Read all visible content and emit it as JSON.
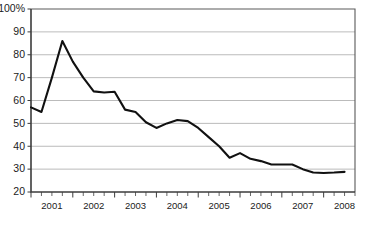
{
  "chart_data": {
    "type": "line",
    "title": "",
    "subtitle": "",
    "xlabel": "",
    "ylabel": "",
    "ylim": [
      20,
      100
    ],
    "xlim": [
      2001.0,
      2008.75
    ],
    "grid": true,
    "grid_axis": "y",
    "legend": false,
    "legend_position": "none",
    "y_tick_labels": [
      "100%",
      "90",
      "80",
      "70",
      "60",
      "50",
      "40",
      "30",
      "20"
    ],
    "y_tick_values": [
      100,
      90,
      80,
      70,
      60,
      50,
      40,
      30,
      20
    ],
    "x_tick_labels": [
      "2001",
      "2002",
      "2003",
      "2004",
      "2005",
      "2006",
      "2007",
      "2008"
    ],
    "x_tick_values": [
      2001,
      2002,
      2003,
      2004,
      2005,
      2006,
      2007,
      2008
    ],
    "x_minor_ticks_per_year": 4,
    "line_color": "#111111",
    "grid_color": "#a9a9a9",
    "axis_color": "#3c3c3c",
    "background_color": "#ffffff",
    "markers": false,
    "series": [
      {
        "name": "series-1",
        "x": [
          2001.0,
          2001.25,
          2001.5,
          2001.75,
          2002.0,
          2002.25,
          2002.5,
          2002.75,
          2003.0,
          2003.25,
          2003.5,
          2003.75,
          2004.0,
          2004.25,
          2004.5,
          2004.75,
          2005.0,
          2005.25,
          2005.5,
          2005.75,
          2006.0,
          2006.25,
          2006.5,
          2006.75,
          2007.0,
          2007.25,
          2007.5,
          2007.75,
          2008.0,
          2008.25,
          2008.5
        ],
        "values": [
          57.0,
          55.0,
          70.0,
          86.0,
          77.0,
          70.0,
          64.0,
          63.5,
          63.8,
          56.0,
          55.0,
          50.5,
          48.0,
          50.0,
          51.5,
          51.0,
          48.0,
          44.0,
          40.0,
          35.0,
          37.0,
          34.5,
          33.5,
          32.0,
          32.0,
          32.0,
          30.0,
          28.5,
          28.3,
          28.5,
          28.8
        ]
      }
    ]
  }
}
